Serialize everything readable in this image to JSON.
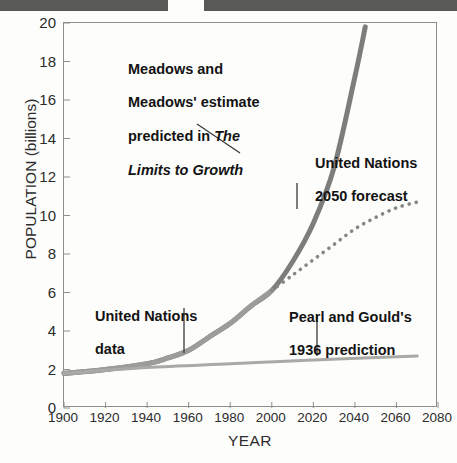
{
  "figure": {
    "background_color": "#fdfdfc",
    "scan_bar_color": "#595a58"
  },
  "chart_data": {
    "type": "line",
    "title": "",
    "xlabel": "YEAR",
    "ylabel": "POPULATION (billions)",
    "xlim": [
      1900,
      2080
    ],
    "ylim": [
      0,
      20
    ],
    "xticks": [
      1900,
      1920,
      1940,
      1960,
      1980,
      2000,
      2020,
      2040,
      2060,
      2080
    ],
    "yticks": [
      0,
      2,
      4,
      6,
      8,
      10,
      12,
      14,
      16,
      18,
      20
    ],
    "grid": false,
    "legend_position": "none",
    "series": [
      {
        "name": "Meadows and Meadows' estimate predicted in The Limits to Growth",
        "style": "solid-thick",
        "color": "#7d7d7b",
        "x": [
          1900,
          1920,
          1940,
          1950,
          1960,
          1970,
          1980,
          1990,
          2000,
          2010,
          2020,
          2030,
          2040,
          2045
        ],
        "values": [
          1.8,
          2.0,
          2.3,
          2.6,
          3.0,
          3.7,
          4.4,
          5.3,
          6.1,
          7.6,
          9.6,
          12.5,
          17.2,
          19.8
        ]
      },
      {
        "name": "United Nations data",
        "style": "solid-thick",
        "color": "#9c9c99",
        "x": [
          1900,
          1920,
          1940,
          1950,
          1960,
          1970,
          1980,
          1990,
          2000
        ],
        "values": [
          1.8,
          2.0,
          2.3,
          2.6,
          3.0,
          3.7,
          4.4,
          5.3,
          6.1
        ]
      },
      {
        "name": "United Nations 2050 forecast",
        "style": "dotted",
        "color": "#868684",
        "x": [
          2000,
          2010,
          2020,
          2030,
          2040,
          2050,
          2060,
          2070
        ],
        "values": [
          6.1,
          6.9,
          7.7,
          8.5,
          9.3,
          9.9,
          10.4,
          10.7
        ]
      },
      {
        "name": "Pearl and Gould's 1936 prediction",
        "style": "solid-thin",
        "color": "#a9a9a6",
        "x": [
          1900,
          1940,
          1980,
          2020,
          2070
        ],
        "values": [
          1.8,
          2.1,
          2.3,
          2.5,
          2.7
        ]
      }
    ],
    "annotations": [
      {
        "id": "meadows",
        "line1": "Meadows and",
        "line2": "Meadows' estimate",
        "line3_plain": "predicted in ",
        "line3_italic": "The",
        "line4_italic": "Limits to Growth",
        "leader": "diagonal"
      },
      {
        "id": "un_forecast",
        "line1": "United Nations",
        "line2": "2050 forecast",
        "leader": "vertical"
      },
      {
        "id": "un_data",
        "line1": "United Nations",
        "line2": "data",
        "leader": "vertical"
      },
      {
        "id": "pearl_gould",
        "line1": "Pearl and Gould's",
        "line2": "1936 prediction",
        "leader": "vertical"
      }
    ]
  }
}
